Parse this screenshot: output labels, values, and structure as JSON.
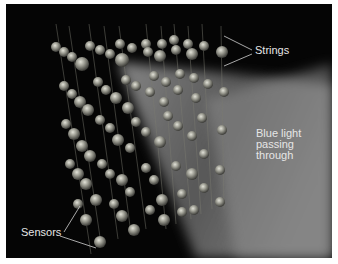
{
  "diagram": {
    "type": "sensor-array-illustration",
    "labels": {
      "strings": "Strings",
      "light_line1": "Blue light",
      "light_line2": "passing",
      "light_line3": "through",
      "sensors": "Sensors"
    },
    "colors": {
      "background": "#050505",
      "border": "#ffffff",
      "sensor": "#9a9a90",
      "light": "#a8a8a8",
      "label": "#e6e6e6"
    }
  }
}
